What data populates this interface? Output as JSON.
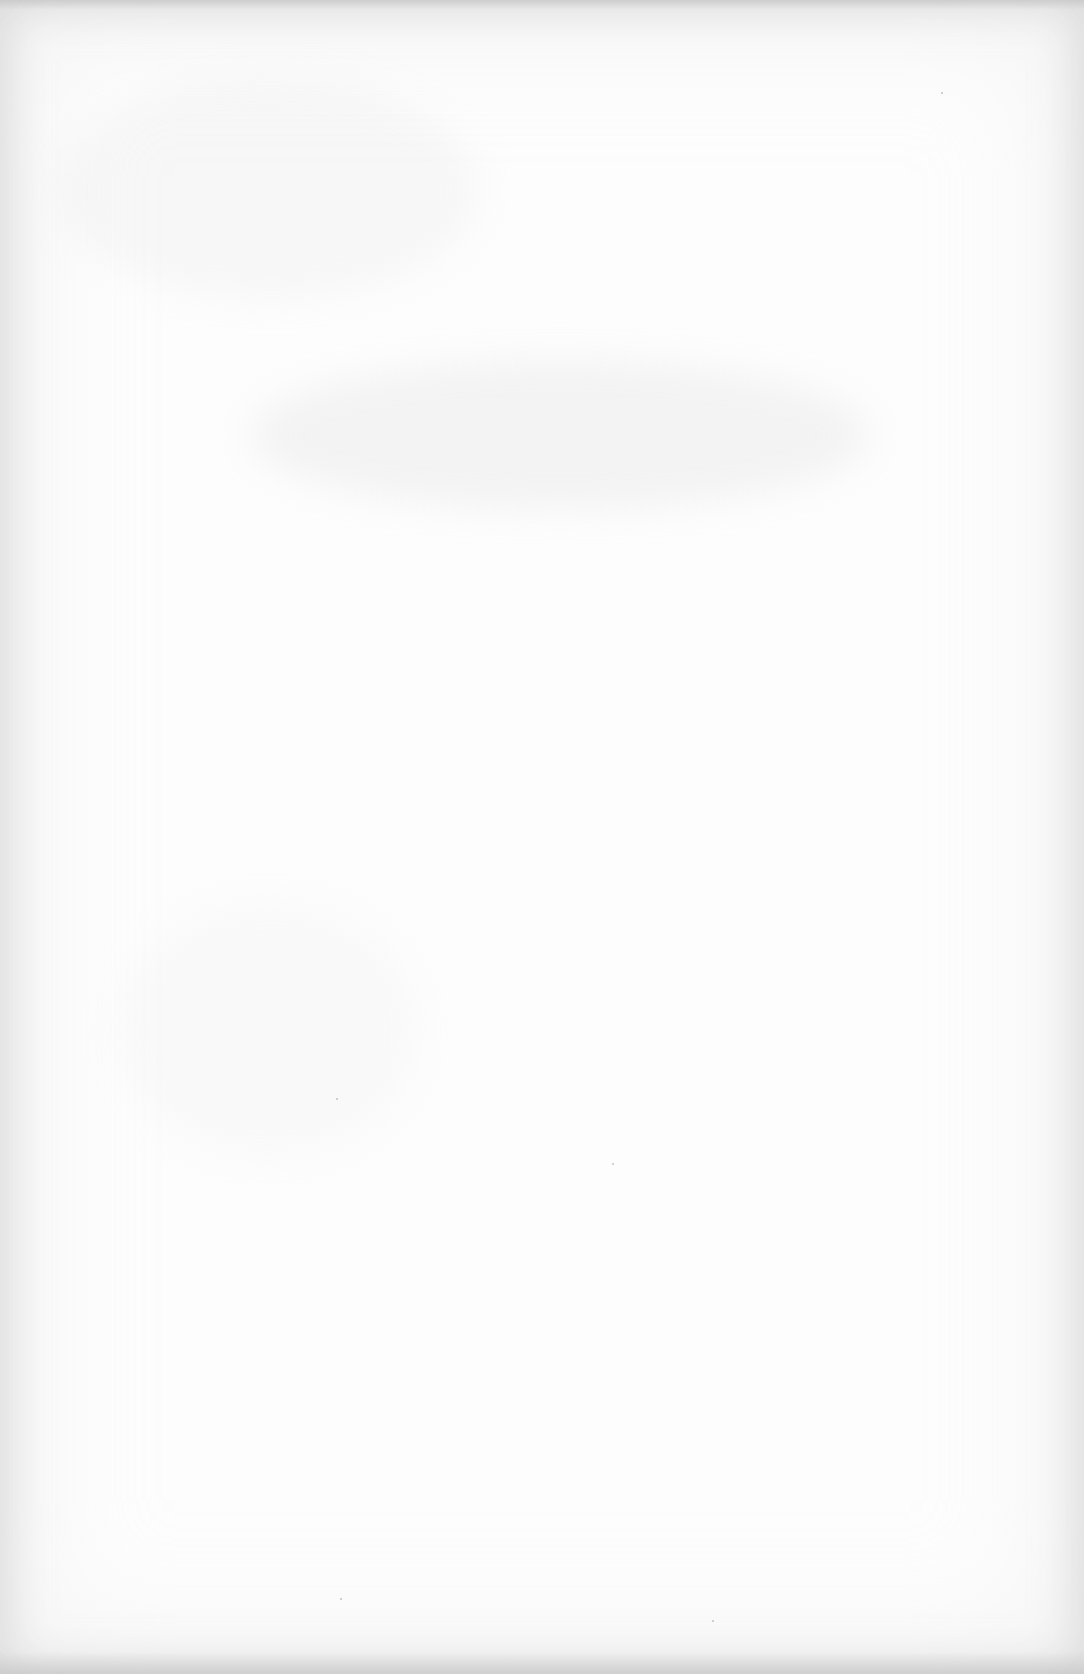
{
  "document": {
    "type": "blank scanned page",
    "visible_text": [],
    "paper_color": "#fdfdfd",
    "edge_shadow_color": "#c8c8c8"
  }
}
